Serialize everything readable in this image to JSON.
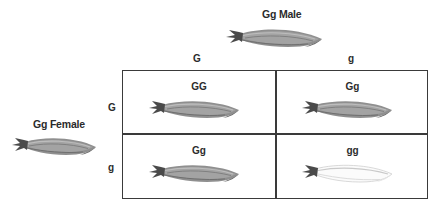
{
  "diagram": {
    "type": "punnett-square",
    "title_male": "Gg Male",
    "title_female": "Gg Female",
    "column_headers": [
      "G",
      "g"
    ],
    "row_headers": [
      "G",
      "g"
    ],
    "cells": [
      {
        "genotype": "GG",
        "phenotype": "dark",
        "row": 0,
        "col": 0
      },
      {
        "genotype": "Gg",
        "phenotype": "dark",
        "row": 0,
        "col": 1
      },
      {
        "genotype": "Gg",
        "phenotype": "dark",
        "row": 1,
        "col": 0
      },
      {
        "genotype": "gg",
        "phenotype": "pale",
        "row": 1,
        "col": 1
      }
    ],
    "colors": {
      "text": "#2b2b2b",
      "grid_line": "#3a3a3a",
      "background": "#ffffff",
      "squash_dark_body": "#8f8f8f",
      "squash_dark_shade": "#6f6f6f",
      "squash_dark_highlight": "#b4b4b4",
      "squash_stem": "#4a4a4a",
      "squash_pale_body": "#fbfbfb",
      "squash_pale_outline": "#bdbdbd"
    }
  }
}
